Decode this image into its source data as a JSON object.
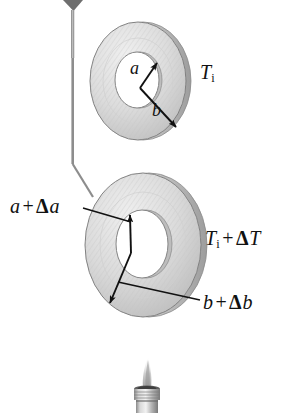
{
  "figure": {
    "background_color": "#ffffff",
    "width": 308,
    "height": 413
  },
  "colors": {
    "ink": "#111111",
    "washer_face_light": "#e9e9e9",
    "washer_face_mid": "#d4d4d4",
    "washer_face_dark": "#b8b8b8",
    "washer_rim": "#9a9a9a",
    "washer_outline": "#7c7c7c",
    "hole_fill": "#ffffff",
    "hatch_line": "#c2c2c2",
    "metal_light": "#dcdcdc",
    "metal_mid": "#a8a8a8",
    "metal_dark": "#6f6f6f",
    "flame": "#b5b5b5",
    "pointer_dark": "#5a5a5a"
  },
  "labels": {
    "initial_temperature": {
      "var": "T",
      "sub": "i",
      "full_text": "T_i"
    },
    "final_temperature": {
      "var": "T",
      "sub": "i",
      "op": "+",
      "delta": "Δ",
      "delta_var": "T",
      "full_text": "T_i + ΔT"
    },
    "inner_radius": {
      "var": "a",
      "full_text": "a"
    },
    "outer_radius": {
      "var": "b",
      "full_text": "b"
    },
    "inner_radius_expanded": {
      "var": "a",
      "op": "+",
      "delta": "Δ",
      "delta_var": "a",
      "full_text": "a + Δa"
    },
    "outer_radius_expanded": {
      "var": "b",
      "op": "+",
      "delta": "Δ",
      "delta_var": "b",
      "full_text": "b + Δb"
    }
  },
  "objects": {
    "washer_initial": {
      "name": "washer-initial",
      "center_x": 138,
      "center_y": 81,
      "outer_rx": 48,
      "outer_ry": 59,
      "inner_rx": 22,
      "inner_ry": 28,
      "state": "unheated"
    },
    "washer_expanded": {
      "name": "washer-expanded",
      "center_x": 143,
      "center_y": 245,
      "outer_rx": 58,
      "outer_ry": 72,
      "inner_rx": 26,
      "inner_ry": 34,
      "state": "heated"
    },
    "torch": {
      "name": "torch-burner",
      "flame_tip_y": 356,
      "nozzle_top_y": 388,
      "nozzle_bottom_y": 413
    },
    "pointer": {
      "name": "pointer-probe",
      "description": "thin probe line from top of frame bending toward expanded washer"
    }
  }
}
